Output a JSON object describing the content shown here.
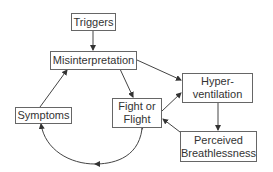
{
  "diagram": {
    "type": "flow-cycle",
    "nodes": {
      "triggers": "Triggers",
      "misinterpretation": "Misinterpretation",
      "hyperventilation_l1": "Hyper-",
      "hyperventilation_l2": "ventilation",
      "fight_l1": "Fight or",
      "fight_l2": "Flight",
      "symptoms": "Symptoms",
      "breath_l1": "Perceived",
      "breath_l2": "Breathlessness"
    },
    "edges": [
      {
        "from": "Triggers",
        "to": "Misinterpretation"
      },
      {
        "from": "Misinterpretation",
        "to": "Hyper-ventilation"
      },
      {
        "from": "Misinterpretation",
        "to": "Fight or Flight"
      },
      {
        "from": "Fight or Flight",
        "to": "Hyper-ventilation"
      },
      {
        "from": "Hyper-ventilation",
        "to": "Perceived Breathlessness"
      },
      {
        "from": "Perceived Breathlessness",
        "to": "Fight or Flight"
      },
      {
        "from": "Fight or Flight",
        "to": "Symptoms",
        "curved": true,
        "bidirectional": true
      },
      {
        "from": "Symptoms",
        "to": "Misinterpretation"
      }
    ]
  }
}
